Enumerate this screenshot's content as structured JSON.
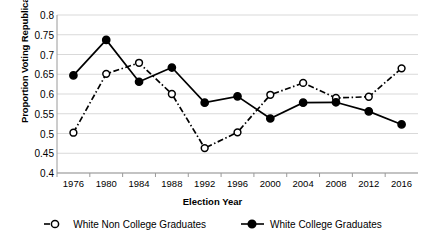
{
  "chart_data": {
    "type": "line",
    "title": "",
    "xlabel": "Election Year",
    "ylabel": "Proportion Voting Republican",
    "categories": [
      "1976",
      "1980",
      "1984",
      "1988",
      "1992",
      "1996",
      "2000",
      "2004",
      "2008",
      "2012",
      "2016"
    ],
    "ylim": [
      0.4,
      0.8
    ],
    "yticks": [
      "0.4",
      "0.45",
      "0.5",
      "0.55",
      "0.6",
      "0.65",
      "0.7",
      "0.75",
      "0.8"
    ],
    "ytick_values": [
      0.4,
      0.45,
      0.5,
      0.55,
      0.6,
      0.65,
      0.7,
      0.75,
      0.8
    ],
    "grid": true,
    "legend_position": "bottom",
    "series": [
      {
        "name": "White Non College Graduates",
        "marker": "open-circle",
        "line_style": "dash-dot",
        "color": "#000000",
        "values": [
          0.502,
          0.651,
          0.679,
          0.6,
          0.463,
          0.503,
          0.598,
          0.628,
          0.59,
          0.593,
          0.665
        ]
      },
      {
        "name": "White College Graduates",
        "marker": "filled-circle",
        "line_style": "solid",
        "color": "#000000",
        "values": [
          0.647,
          0.737,
          0.631,
          0.667,
          0.578,
          0.594,
          0.538,
          0.578,
          0.579,
          0.556,
          0.523
        ]
      }
    ]
  }
}
